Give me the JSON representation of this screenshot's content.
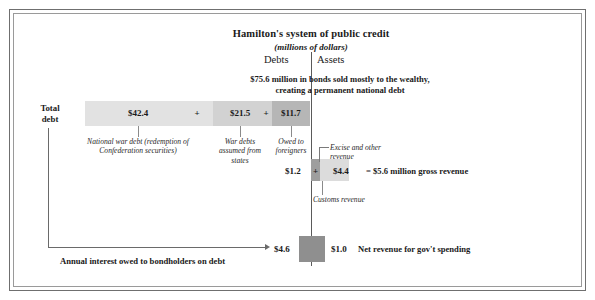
{
  "figure": {
    "title": "Hamilton's system of public credit",
    "subtitle": "(millions of dollars)",
    "axis_left_label": "Debts",
    "axis_right_label": "Assets",
    "total_debt_label": "Total\ndebt",
    "debt_lead": "$75.6 million in bonds sold mostly to the wealthy,\ncreating a permanent national debt",
    "interest_note": "Annual interest owed to bondholders on debt",
    "gross_revenue_note": "= $5.6 million gross revenue",
    "net_revenue_note": "Net revenue for gov't spending"
  },
  "chart_data": {
    "type": "bar",
    "title": "Hamilton's system of public credit",
    "subtitle": "(millions of dollars)",
    "units": "millions of dollars",
    "debt_total": 75.6,
    "debt_segments": [
      {
        "value": "$42.4",
        "amount": 42.4,
        "caption": "National war debt (redemption of Confederation securities)"
      },
      {
        "value": "$21.5",
        "amount": 21.5,
        "caption": "War debts assumed from states"
      },
      {
        "value": "$11.7",
        "amount": 11.7,
        "caption": "Owed to foreigners"
      }
    ],
    "operator": "+",
    "revenue_segments": [
      {
        "value": "$1.2",
        "amount": 1.2,
        "caption": "Customs revenue"
      },
      {
        "value": "$4.4",
        "amount": 4.4,
        "caption": "Excise and other revenue"
      }
    ],
    "gross_revenue": "$5.6",
    "interest_paid": "$4.6",
    "net_revenue": "$1.0"
  },
  "colors": {
    "segment_light": "#e2e2e2",
    "segment_mid": "#d2d2d2",
    "segment_dark": "#b6b6b6",
    "box_dark": "#8f8f8f",
    "rule": "#6a6a6a"
  }
}
